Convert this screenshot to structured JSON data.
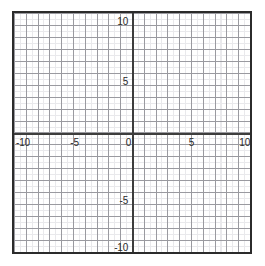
{
  "chart_data": {
    "type": "scatter",
    "title": "",
    "subtitle": "",
    "xlabel": "",
    "ylabel": "",
    "xlim": [
      -10,
      10
    ],
    "ylim": [
      -10,
      10
    ],
    "grid": true,
    "minor_grid": true,
    "major_gridline_step": 1,
    "minor_gridline_step": 0.5,
    "legend": null,
    "series": [],
    "x_tick_labels": [
      "-10",
      "-5",
      "0",
      "5",
      "10"
    ],
    "x_tick_values": [
      -10,
      -5,
      0,
      5,
      10
    ],
    "y_tick_labels": [
      "10",
      "5",
      "-5",
      "-10"
    ],
    "y_tick_values": [
      10,
      5,
      -5,
      -10
    ],
    "annotations": []
  },
  "axes": {
    "x_axis_name": "x-axis",
    "y_axis_name": "y-axis",
    "origin_label": "0",
    "ticks": {
      "x_neg10": "-10",
      "x_neg5": "-5",
      "x_zero": "0",
      "x_pos5": "5",
      "x_pos10": "10",
      "y_pos10": "10",
      "y_pos5": "5",
      "y_neg5": "-5",
      "y_neg10": "-10"
    }
  },
  "colors": {
    "frame": "#2b2b2b",
    "axis": "#3d3d3d",
    "major_gridline": "#9a9aa0",
    "minor_gridline": "#e9e9ec",
    "background": "#ffffff",
    "label_text": "#2b2b2b"
  }
}
